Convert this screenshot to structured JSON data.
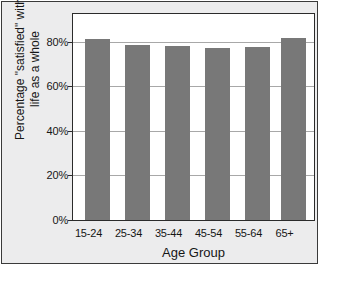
{
  "chart_data": {
    "type": "bar",
    "title": "",
    "categories": [
      "15-24",
      "25-34",
      "35-44",
      "45-54",
      "55-64",
      "65+"
    ],
    "values": [
      81,
      78.5,
      78,
      77,
      77.5,
      81.5
    ],
    "series": [
      {
        "name": "Percentage satisfied",
        "values": [
          81,
          78.5,
          78,
          77,
          77.5,
          81.5
        ]
      }
    ],
    "xlabel": "Age Group",
    "ylabel": "Percentage \"satisfied\" with life as a whole",
    "ylabel_line1": "Percentage \"satisfied\" with",
    "ylabel_line2": "life as a whole",
    "ylim": [
      0,
      92
    ],
    "ytick_values": [
      0,
      20,
      40,
      60,
      80
    ],
    "ytick_labels": [
      "0%",
      "20%",
      "40%",
      "60%",
      "80%"
    ],
    "grid": true,
    "legend": false,
    "bar_color": "#787878",
    "plot_background": "#ffffff",
    "figure_background": "#ececed",
    "gridline_color": "#a8a8a8",
    "axis_color": "#2b2b2b"
  },
  "footer": {
    "note": ""
  }
}
